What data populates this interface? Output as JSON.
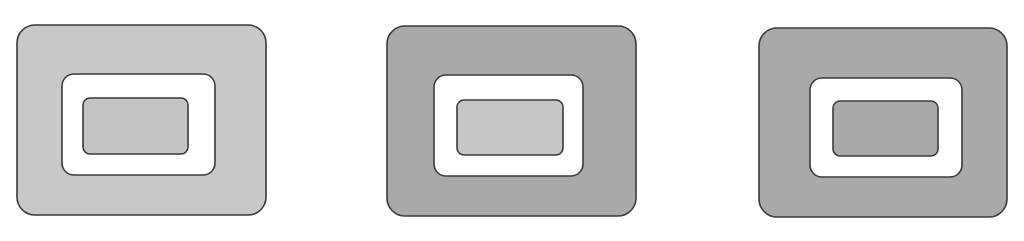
{
  "figure": {
    "panels": [
      {
        "id": "panel-1",
        "outer": {
          "x": 17,
          "y": 25,
          "w": 249,
          "h": 190,
          "r": 18,
          "fill": "#c9c9c9"
        },
        "middle": {
          "x": 62,
          "y": 74,
          "w": 153,
          "h": 101,
          "r": 12,
          "fill": "#ffffff"
        },
        "inner": {
          "x": 83,
          "y": 98,
          "w": 105,
          "h": 56,
          "r": 7,
          "fill": "#c4c4c4"
        }
      },
      {
        "id": "panel-2",
        "outer": {
          "x": 387,
          "y": 26,
          "w": 249,
          "h": 190,
          "r": 18,
          "fill": "#a9a9a9"
        },
        "middle": {
          "x": 434,
          "y": 75,
          "w": 149,
          "h": 101,
          "r": 12,
          "fill": "#ffffff"
        },
        "inner": {
          "x": 457,
          "y": 100,
          "w": 106,
          "h": 55,
          "r": 7,
          "fill": "#c6c6c6"
        }
      },
      {
        "id": "panel-3",
        "outer": {
          "x": 759,
          "y": 28,
          "w": 248,
          "h": 189,
          "r": 18,
          "fill": "#a9a9a9"
        },
        "middle": {
          "x": 810,
          "y": 78,
          "w": 152,
          "h": 99,
          "r": 12,
          "fill": "#ffffff"
        },
        "inner": {
          "x": 833,
          "y": 101,
          "w": 105,
          "h": 55,
          "r": 7,
          "fill": "#a9a9a9"
        }
      }
    ],
    "stroke": "#3a3a3a",
    "stroke_width": 1.6
  }
}
